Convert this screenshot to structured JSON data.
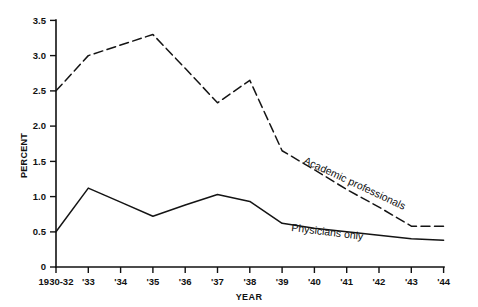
{
  "chart_data": {
    "type": "line",
    "title": "",
    "xlabel": "YEAR",
    "ylabel": "PERCENT",
    "categories": [
      "1930-32",
      "'33",
      "'34",
      "'35",
      "'36",
      "'37",
      "'38",
      "'39",
      "'40",
      "'41",
      "'42",
      "'43",
      "'44"
    ],
    "ylim": [
      0,
      3.5
    ],
    "xlim": [
      0,
      12
    ],
    "yticks": [
      "0",
      "0.5",
      "1.0",
      "1.5",
      "2.0",
      "2.5",
      "3.0",
      "3.5"
    ],
    "ytick_values": [
      0,
      0.5,
      1.0,
      1.5,
      2.0,
      2.5,
      3.0,
      3.5
    ],
    "grid": false,
    "legend_position": "inline-annotations",
    "series": [
      {
        "name": "Academic professionals",
        "style": "dashed",
        "values": [
          2.5,
          3.0,
          3.15,
          3.3,
          2.82,
          2.33,
          2.65,
          1.65,
          1.38,
          1.1,
          0.85,
          0.58,
          0.58
        ]
      },
      {
        "name": "Physicians only",
        "style": "solid",
        "values": [
          0.5,
          1.12,
          0.92,
          0.72,
          0.88,
          1.03,
          0.93,
          0.62,
          0.55,
          0.5,
          0.45,
          0.4,
          0.38
        ]
      }
    ],
    "annotations": [
      {
        "text": "Academic professionals",
        "for_series": "Academic professionals"
      },
      {
        "text": "Physicians only",
        "for_series": "Physicians only"
      }
    ]
  }
}
